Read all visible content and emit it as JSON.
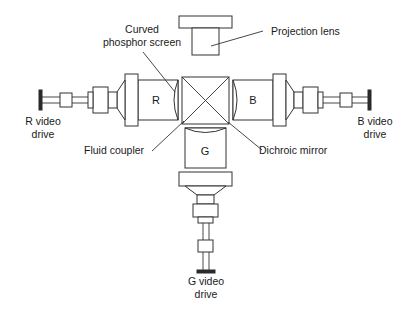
{
  "diagram": {
    "labels": {
      "projection_lens": "Projection lens",
      "curved_screen_line1": "Curved",
      "curved_screen_line2": "phosphor screen",
      "fluid_coupler": "Fluid coupler",
      "dichroic_mirror": "Dichroic mirror",
      "r_drive_line1": "R video",
      "r_drive_line2": "drive",
      "b_drive_line1": "B video",
      "b_drive_line2": "drive",
      "g_drive_line1": "G video",
      "g_drive_line2": "drive"
    },
    "tubes": {
      "red": "R",
      "green": "G",
      "blue": "B"
    },
    "colors": {
      "stroke": "#333333",
      "text": "#1a1a1a",
      "background": "#ffffff"
    }
  }
}
